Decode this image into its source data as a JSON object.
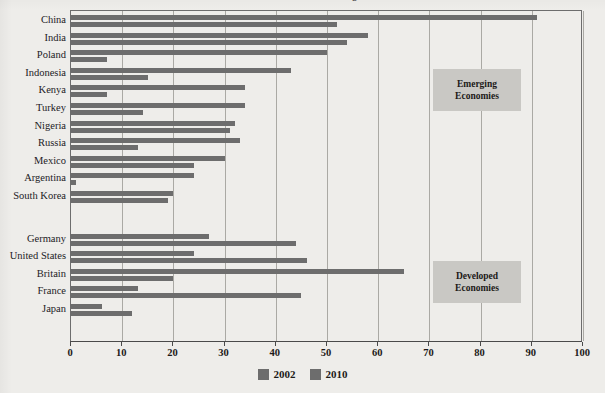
{
  "chart_data": {
    "type": "bar",
    "orientation": "horizontal",
    "title": "Global Ranking",
    "categories": [
      "China",
      "India",
      "Poland",
      "Indonesia",
      "Kenya",
      "Turkey",
      "Nigeria",
      "Russia",
      "Mexico",
      "Argentina",
      "South Korea",
      "Germany",
      "United States",
      "Britain",
      "France",
      "Japan"
    ],
    "series": [
      {
        "name": "2002",
        "color": "#6d6d6d",
        "values": [
          52,
          54,
          7,
          15,
          7,
          14,
          31,
          13,
          24,
          1,
          19,
          44,
          46,
          20,
          45,
          12
        ]
      },
      {
        "name": "2010",
        "color": "#6d6d6d",
        "values": [
          91,
          58,
          50,
          43,
          34,
          34,
          32,
          33,
          30,
          24,
          20,
          27,
          24,
          65,
          13,
          6
        ]
      }
    ],
    "xlabel": "",
    "ylabel": "",
    "xlim": [
      0,
      100
    ],
    "xticks": [
      0,
      10,
      20,
      30,
      40,
      50,
      60,
      70,
      80,
      90,
      100
    ],
    "xtick_labels": [
      "0",
      "10",
      "20",
      "30",
      "40",
      "50",
      "60",
      "70",
      "80",
      "90",
      "100"
    ],
    "grid": true,
    "grid_axis": "x",
    "legend": {
      "position": "bottom-center",
      "entries": [
        {
          "label": "2002",
          "color": "#6d6d6d"
        },
        {
          "label": "2010",
          "color": "#6d6d6d"
        }
      ]
    },
    "annotations": [
      {
        "id": "emerging",
        "line1": "Emerging",
        "line2": "Economies"
      },
      {
        "id": "developed",
        "line1": "Developed",
        "line2": "Economies"
      }
    ],
    "group_break_after": "South Korea",
    "colors": {
      "background": "#eeedea",
      "bar": "#6d6d6d",
      "grid": "#aaa9a4",
      "frame": "#6d6d6d",
      "annotation_box": "#c9c8c4",
      "text": "#1c1a18"
    }
  }
}
